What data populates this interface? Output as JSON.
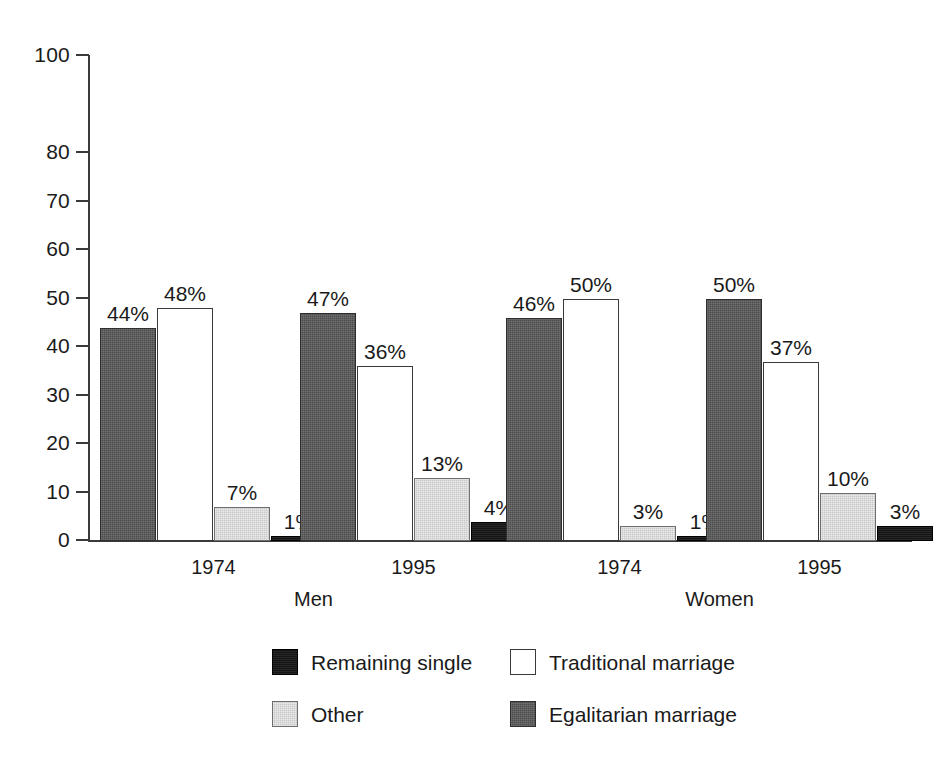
{
  "chart_data": {
    "type": "bar",
    "title": "",
    "subtitle": "",
    "xlabel": "",
    "ylabel": "",
    "ylim": [
      0,
      100
    ],
    "ytick_labels": [
      "0",
      "10",
      "20",
      "30",
      "40",
      "50",
      "60",
      "70",
      "80",
      "100"
    ],
    "ytick_values": [
      0,
      10,
      20,
      30,
      40,
      50,
      60,
      70,
      80,
      100
    ],
    "grid": false,
    "legend_position": "bottom",
    "categories": [
      "1974",
      "1995",
      "1974",
      "1995"
    ],
    "group_labels": [
      "Men",
      "Women"
    ],
    "groups": [
      {
        "group": "Men",
        "year": "1974",
        "bars": [
          {
            "series": "Egalitarian marriage",
            "value": 44,
            "label": "44%"
          },
          {
            "series": "Traditional marriage",
            "value": 48,
            "label": "48%"
          },
          {
            "series": "Other",
            "value": 7,
            "label": "7%"
          },
          {
            "series": "Remaining single",
            "value": 1,
            "label": "1%"
          }
        ]
      },
      {
        "group": "Men",
        "year": "1995",
        "bars": [
          {
            "series": "Egalitarian marriage",
            "value": 47,
            "label": "47%"
          },
          {
            "series": "Traditional marriage",
            "value": 36,
            "label": "36%"
          },
          {
            "series": "Other",
            "value": 13,
            "label": "13%"
          },
          {
            "series": "Remaining single",
            "value": 4,
            "label": "4%"
          }
        ]
      },
      {
        "group": "Women",
        "year": "1974",
        "bars": [
          {
            "series": "Egalitarian marriage",
            "value": 46,
            "label": "46%"
          },
          {
            "series": "Traditional marriage",
            "value": 50,
            "label": "50%"
          },
          {
            "series": "Other",
            "value": 3,
            "label": "3%"
          },
          {
            "series": "Remaining single",
            "value": 1,
            "label": "1%"
          }
        ]
      },
      {
        "group": "Women",
        "year": "1995",
        "bars": [
          {
            "series": "Egalitarian marriage",
            "value": 50,
            "label": "50%"
          },
          {
            "series": "Traditional marriage",
            "value": 37,
            "label": "37%"
          },
          {
            "series": "Other",
            "value": 10,
            "label": "10%"
          },
          {
            "series": "Remaining single",
            "value": 3,
            "label": "3%"
          }
        ]
      }
    ],
    "series": [
      {
        "name": "Remaining single",
        "key": "single",
        "color": "#151515",
        "values": [
          1,
          4,
          1,
          3
        ]
      },
      {
        "name": "Traditional marriage",
        "key": "traditional",
        "color": "#ffffff",
        "values": [
          48,
          36,
          50,
          37
        ]
      },
      {
        "name": "Other",
        "key": "other",
        "color": "#c9c9c9",
        "values": [
          7,
          13,
          3,
          10
        ]
      },
      {
        "name": "Egalitarian marriage",
        "key": "egalitarian",
        "color": "#4d4d4d",
        "values": [
          44,
          47,
          46,
          50
        ]
      }
    ],
    "legend": [
      {
        "label": "Remaining single",
        "key": "single",
        "color": "#151515"
      },
      {
        "label": "Traditional marriage",
        "key": "traditional",
        "color": "#ffffff"
      },
      {
        "label": "Other",
        "key": "other",
        "color": "#c9c9c9"
      },
      {
        "label": "Egalitarian marriage",
        "key": "egalitarian",
        "color": "#4d4d4d"
      }
    ]
  },
  "colors": {
    "background": "#ffffff",
    "axis": "#3a3a3a",
    "text": "#1a1a1a",
    "egalitarian": "#4d4d4d",
    "traditional": "#ffffff",
    "other": "#c9c9c9",
    "single": "#151515"
  }
}
